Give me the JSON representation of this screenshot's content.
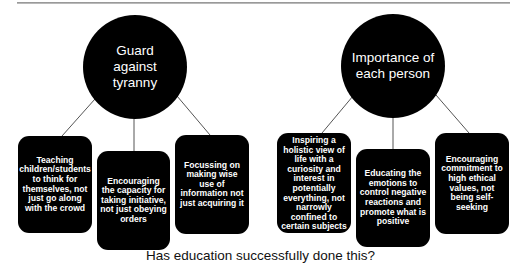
{
  "diagram": {
    "colors": {
      "node_fill": "#000000",
      "node_text": "#ffffff",
      "connector": "#555555",
      "background": "#ffffff"
    },
    "groups": [
      {
        "title": "Guard against tyranny",
        "title_lines": [
          "Guard against",
          "tyranny"
        ],
        "children": [
          "Teaching children/students to think for themselves, not just go along with the crowd",
          "Encouraging the capacity for taking initiative, not just obeying orders",
          "Focussing on making wise use of information not just acquiring it"
        ]
      },
      {
        "title": "Importance of each person",
        "title_lines": [
          "Importance of",
          "each person"
        ],
        "children": [
          "Inspiring a holistic view of life with a curiosity and interest in potentially everything, not narrowly confined to certain subjects",
          "Educating the emotions to control negative reactions and promote what is positive",
          "Encouraging commitment to high ethical values, not being self-seeking"
        ]
      }
    ],
    "caption": "Has education successfully done this?"
  }
}
